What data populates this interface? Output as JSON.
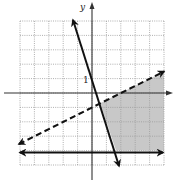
{
  "chart_data": {
    "type": "line",
    "title": "",
    "xlabel": "x",
    "ylabel": "y",
    "xlim": [
      -5,
      5
    ],
    "ylim": [
      -5,
      5
    ],
    "grid": true,
    "tick_labels": [
      {
        "axis": "y",
        "value": 1,
        "text": "1"
      }
    ],
    "series": [
      {
        "name": "y = -3x + 1",
        "style": "solid",
        "slope": -3,
        "intercept": 1,
        "arrows": "both",
        "x": [
          -1.33,
          2.0
        ],
        "y": [
          5,
          -5
        ]
      },
      {
        "name": "y = 0.5x - 1",
        "style": "dashed",
        "slope": 0.5,
        "intercept": -1,
        "arrows": "both",
        "x": [
          -5,
          5
        ],
        "y": [
          -3.5,
          1.5
        ]
      },
      {
        "name": "y = -4",
        "style": "solid",
        "slope": 0,
        "intercept": -4,
        "arrows": "both",
        "x": [
          -5,
          5
        ],
        "y": [
          -4,
          -4
        ]
      }
    ],
    "shaded_region": {
      "description": "Region right of y = -3x + 1, below dashed y = 0.5x - 1, above y = -4",
      "inequalities": [
        "y > -3x + 1",
        "y < 0.5x - 1",
        "y >= -4"
      ],
      "vertices": [
        [
          0.57,
          -0.71
        ],
        [
          5,
          1.5
        ],
        [
          5,
          -4
        ],
        [
          1.67,
          -4
        ]
      ],
      "color": "#c8c8c8"
    }
  },
  "axes": {
    "x_label": "x",
    "y_label": "y",
    "y_tick_1": "1"
  },
  "colors": {
    "line": "#111111",
    "grid": "#9a9a9a",
    "shade": "#c8c8c8",
    "background": "#ffffff"
  }
}
